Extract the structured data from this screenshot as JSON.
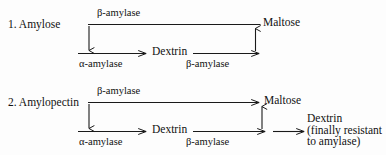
{
  "figure": {
    "type": "biochemical-pathway-diagram",
    "background_color": "#fdfdfd",
    "line_color": "#1a1a1a",
    "text_color": "#111111"
  },
  "schemes": [
    {
      "index_label": "1. Amylose",
      "substrate": "Amylose",
      "top_enzyme": "β-amylase",
      "top_product": "Maltose",
      "left_enzyme": "α-amylase",
      "intermediate": "Dextrin",
      "right_enzyme": "β-amylase"
    },
    {
      "index_label": "2. Amylopectin",
      "substrate": "Amylopectin",
      "top_enzyme": "β-amylase",
      "top_product": "Maltose",
      "left_enzyme": "α-amylase",
      "intermediate": "Dextrin",
      "right_enzyme": "β-amylase",
      "residue_line_1": "Dextrin",
      "residue_line_2": "(finally resistant",
      "residue_line_3": "to amylase)"
    }
  ]
}
